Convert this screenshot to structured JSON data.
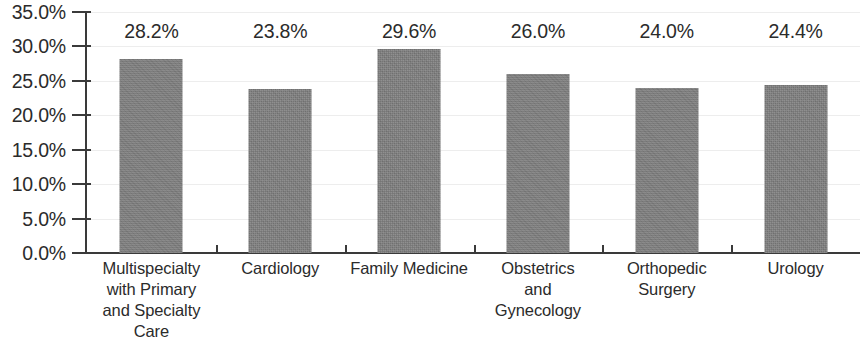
{
  "chart_data": {
    "type": "bar",
    "title": "",
    "subtitle": "",
    "xlabel": "",
    "ylabel": "",
    "ylim": [
      0,
      35
    ],
    "y_tick_step": 5,
    "grid": true,
    "legend": false,
    "orientation": "vertical",
    "bar_color": "#7f7f7f",
    "text_color": "#2b2b2b",
    "axis_color": "#3a3a3a",
    "gridline_color": "#ededed",
    "background_color": "#ffffff",
    "value_label_format": "percent_one_decimal",
    "categories": [
      "Multispecialty with Primary and Specialty Care",
      "Cardiology",
      "Family Medicine",
      "Obstetrics and Gynecology",
      "Orthopedic Surgery",
      "Urology"
    ],
    "category_label_lines": [
      [
        "Multispecialty",
        "with Primary",
        "and Specialty",
        "Care"
      ],
      [
        "Cardiology"
      ],
      [
        "Family Medicine"
      ],
      [
        "Obstetrics",
        "and",
        "Gynecology"
      ],
      [
        "Orthopedic",
        "Surgery"
      ],
      [
        "Urology"
      ]
    ],
    "values": [
      28.2,
      23.8,
      29.6,
      26.0,
      24.0,
      24.4
    ],
    "value_labels": [
      "28.2%",
      "23.8%",
      "29.6%",
      "26.0%",
      "24.0%",
      "24.4%"
    ],
    "y_tick_labels": [
      "35.0%",
      "30.0%",
      "25.0%",
      "20.0%",
      "15.0%",
      "10.0%",
      "5.0%",
      "0.0%"
    ],
    "y_tick_values": [
      35,
      30,
      25,
      20,
      15,
      10,
      5,
      0
    ]
  }
}
